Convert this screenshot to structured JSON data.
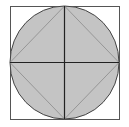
{
  "diagram": {
    "title": "",
    "colors": {
      "background": "#ffffff",
      "square_stroke": "#555555",
      "circle_fill": "#c4c4c4",
      "circle_stroke": "#444444",
      "diameter_stroke": "#222222",
      "diamond_stroke": "#8a8a8a"
    },
    "square": {
      "x": 10,
      "y": 6,
      "width": 109,
      "height": 113
    },
    "circle": {
      "cx": 64.5,
      "cy": 62.5,
      "rx": 54.5,
      "ry": 56.5
    },
    "diameters": [
      {
        "x1": 64.5,
        "y1": 6,
        "x2": 64.5,
        "y2": 119
      },
      {
        "x1": 10,
        "y1": 62.5,
        "x2": 119,
        "y2": 62.5
      }
    ],
    "diamond": [
      [
        64.5,
        6
      ],
      [
        119,
        62.5
      ],
      [
        64.5,
        119
      ],
      [
        10,
        62.5
      ]
    ]
  }
}
